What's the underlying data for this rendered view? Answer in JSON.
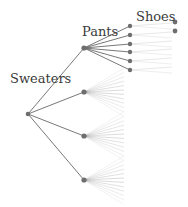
{
  "diagram": {
    "type": "tree",
    "levels": [
      {
        "label": "Sweaters",
        "x": 10,
        "y": 72
      },
      {
        "label": "Pants",
        "x": 82,
        "y": 25
      },
      {
        "label": "Shoes",
        "x": 136,
        "y": 10
      }
    ],
    "root": {
      "x": 28,
      "y": 114
    },
    "pants_nodes": [
      {
        "x": 84,
        "y": 48
      },
      {
        "x": 84,
        "y": 92
      },
      {
        "x": 84,
        "y": 136
      },
      {
        "x": 84,
        "y": 180
      }
    ],
    "shoes_nodes_first_branch": [
      {
        "x": 130,
        "y": 26
      },
      {
        "x": 130,
        "y": 35
      },
      {
        "x": 130,
        "y": 44
      },
      {
        "x": 130,
        "y": 52
      },
      {
        "x": 130,
        "y": 61
      },
      {
        "x": 130,
        "y": 70
      }
    ],
    "leaf_dots": [
      {
        "x": 175,
        "y": 22
      },
      {
        "x": 175,
        "y": 31
      }
    ],
    "branches_per_pants_node": 6,
    "colors": {
      "line": "#555555",
      "node": "#6e6e6e",
      "fade": "#bbbbbb"
    }
  }
}
